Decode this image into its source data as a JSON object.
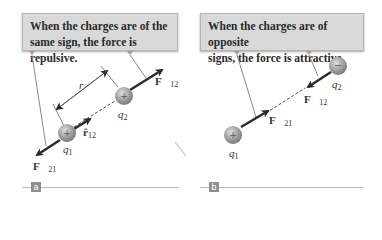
{
  "panels": [
    {
      "id": "a",
      "caption": "When the charges are of the same sign, the force is repulsive.",
      "caption_lines": [
        "When the charges are of the",
        "same sign, the force is repulsive."
      ],
      "tag": "a",
      "labels": {
        "q1": "q",
        "q1_sub": "1",
        "q2": "q",
        "q2_sub": "2",
        "r": "r",
        "r12": "r̂",
        "r12_sub": "12",
        "F12": "F⃗",
        "F12_sub": "12",
        "F21": "F⃗",
        "F21_sub": "21"
      },
      "charges": [
        {
          "name": "q1",
          "sign": "+"
        },
        {
          "name": "q2",
          "sign": "+"
        }
      ]
    },
    {
      "id": "b",
      "caption": "When the charges are of opposite signs, the force is attractive.",
      "caption_lines": [
        "When the charges are of opposite",
        "signs, the force is attractive."
      ],
      "tag": "b",
      "labels": {
        "q1": "q",
        "q1_sub": "1",
        "q2": "q",
        "q2_sub": "2",
        "F12": "F⃗",
        "F12_sub": "12",
        "F21": "F⃗",
        "F21_sub": "21"
      },
      "charges": [
        {
          "name": "q1",
          "sign": "+"
        },
        {
          "name": "q2",
          "sign": "−"
        }
      ]
    }
  ],
  "colors": {
    "callout_bg": "#d9d9d9",
    "charge": "#9a9a9a",
    "arrow": "#2b2b2b",
    "tag_bg": "#8f8f8f"
  }
}
